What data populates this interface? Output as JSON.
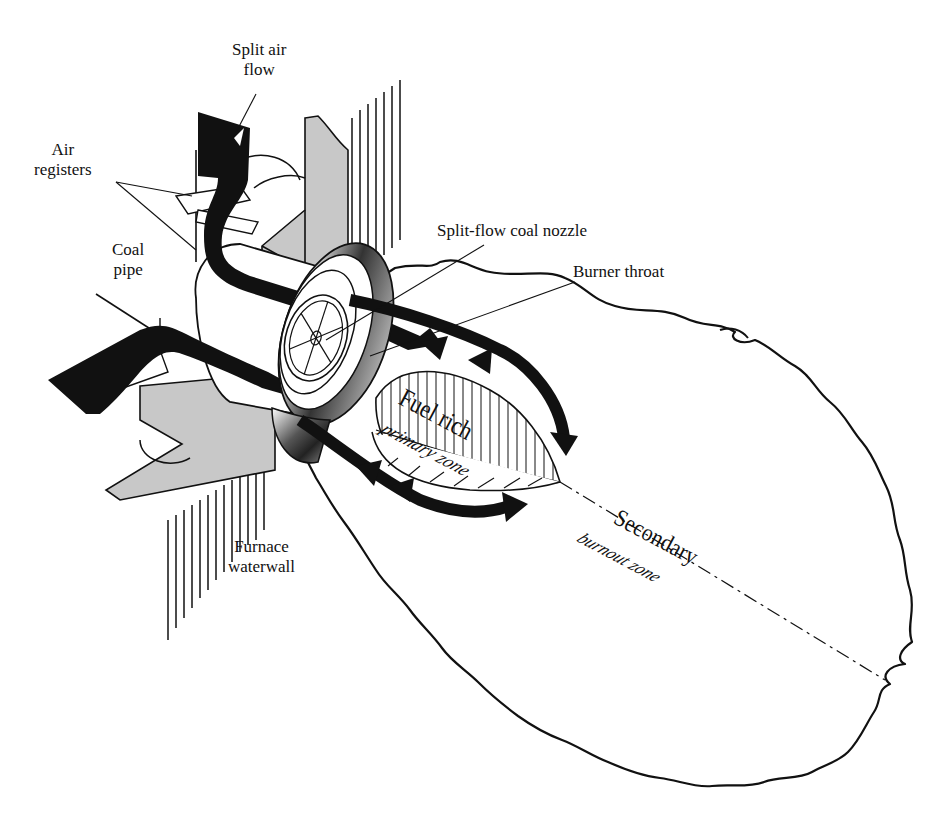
{
  "figure": {
    "type": "split-flow coal burner schematic",
    "colors": {
      "ink": "#111111",
      "wall_gray": "#c8c8c8",
      "background": "#ffffff"
    }
  },
  "labels": {
    "split_air_flow": {
      "line1": "Split air",
      "line2": "flow"
    },
    "air_registers": {
      "line1": "Air",
      "line2": "registers"
    },
    "coal_pipe": {
      "line1": "Coal",
      "line2": "pipe"
    },
    "split_flow_coal_nozzle": "Split-flow coal nozzle",
    "burner_throat": "Burner throat",
    "fuel_rich": "Fuel rich",
    "primary_zone": "primary zone",
    "secondary": "Secondary",
    "burnout_zone": "burnout zone",
    "furnace_waterwall": {
      "line1": "Furnace",
      "line2": "waterwall"
    }
  }
}
